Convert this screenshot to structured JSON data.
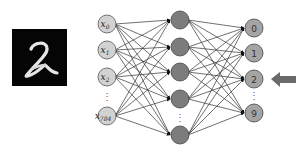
{
  "figure": {
    "input_image": {
      "digit": "2",
      "background": "#050505",
      "stroke": "#e8e8e8"
    },
    "input_layer": {
      "fill": "#d2d2d2",
      "nodes": [
        {
          "base": "x",
          "sub": "0",
          "cy": 24
        },
        {
          "base": "x",
          "sub": "1",
          "cy": 50
        },
        {
          "base": "x",
          "sub": "2",
          "cy": 77
        },
        {
          "base": "x",
          "sub": "784",
          "cy": 116
        }
      ],
      "ellipsis": "⋮",
      "cx": 107
    },
    "hidden_layer": {
      "fill": "#7c7c7c",
      "cx": 180,
      "node_cys": [
        20,
        47,
        72,
        99,
        135
      ],
      "ellipsis": "⋮"
    },
    "output_layer": {
      "fill": "#a4a4a4",
      "cx": 254,
      "nodes": [
        {
          "label": "0",
          "cy": 28
        },
        {
          "label": "1",
          "cy": 53
        },
        {
          "label": "2",
          "cy": 79
        },
        {
          "label": "9",
          "cy": 113
        }
      ],
      "ellipsis": "⋮"
    },
    "prediction_arrow": {
      "points_to": "2",
      "color": "#6a6a6a"
    },
    "edge_color": "#333333"
  }
}
